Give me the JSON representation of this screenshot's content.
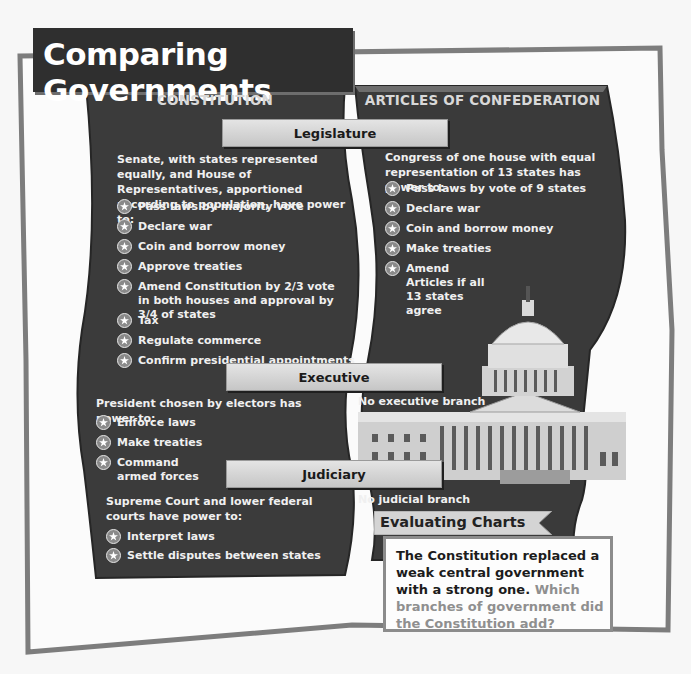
{
  "title": "Comparing Governments",
  "columns": {
    "left": "CONSTITUTION",
    "right": "ARTICLES OF CONFEDERATION"
  },
  "branches": {
    "legislature": {
      "label": "Legislature",
      "constitution": {
        "intro": "Senate, with states represented equally, and House of Representatives, apportioned according to population, have power to:",
        "powers": [
          "Pass laws by majority vote",
          "Declare war",
          "Coin and borrow money",
          "Approve treaties",
          "Amend Constitution by 2/3 vote in both houses and approval by 3/4 of states",
          "Tax",
          "Regulate commerce",
          "Confirm presidential appointments"
        ]
      },
      "articles": {
        "intro": "Congress of one house with equal representation of 13 states has power to:",
        "powers": [
          "Pass laws by vote of 9 states",
          "Declare war",
          "Coin and borrow money",
          "Make treaties",
          "Amend Articles if all 13 states agree"
        ]
      }
    },
    "executive": {
      "label": "Executive",
      "constitution": {
        "intro": "President chosen by electors has power to:",
        "powers": [
          "Enforce laws",
          "Make treaties",
          "Command armed forces"
        ]
      },
      "articles": {
        "intro": "No executive branch"
      }
    },
    "judiciary": {
      "label": "Judiciary",
      "constitution": {
        "intro": "Supreme Court and lower federal courts have power to:",
        "powers": [
          "Interpret laws",
          "Settle disputes between states"
        ]
      },
      "articles": {
        "intro": "No judicial branch"
      }
    }
  },
  "evaluating": {
    "label": "Evaluating Charts",
    "statement": "The Constitution replaced a weak central government with a strong one.",
    "question": "Which branches of government did the Constitution add?"
  },
  "image": {
    "subject": "capitol-building-photo"
  },
  "icons": {
    "bullet": "star-icon"
  },
  "colors": {
    "panel": "#3c3c3c",
    "frame_border": "#7d7d7d",
    "bar": "#d4d4d4",
    "question_text": "#8f8f8f"
  }
}
